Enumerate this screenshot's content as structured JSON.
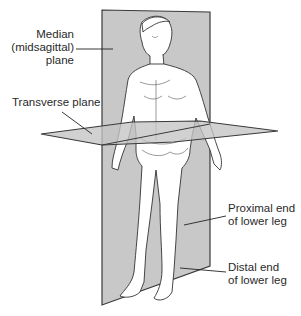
{
  "figure": {
    "colors": {
      "plane_fill": "#c8c8c8",
      "plane_edge": "#3a3a3a",
      "figure_line": "#333333",
      "skin": "#ffffff",
      "text": "#2a2a2a"
    }
  },
  "labels": {
    "median_line1": "Median",
    "median_line2": "(midsagittal)",
    "median_line3": "plane",
    "transverse": "Transverse plane",
    "proximal_line1": "Proximal end",
    "proximal_line2": "of lower leg",
    "distal_line1": "Distal end",
    "distal_line2": "of lower leg"
  }
}
